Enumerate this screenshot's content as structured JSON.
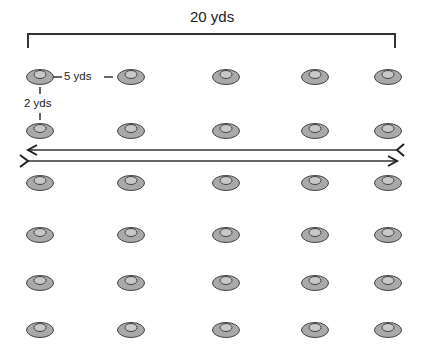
{
  "diagram": {
    "width_label": "20 yds",
    "column_spacing_label": "5 yds",
    "row_spacing_label": "2 yds",
    "grid": {
      "rows": 6,
      "columns": 5,
      "row_centers_y": [
        77,
        131,
        183,
        235,
        283,
        330
      ],
      "column_centers_x": [
        40,
        131,
        226,
        315,
        388
      ]
    },
    "arrows": [
      {
        "direction": "left",
        "y": 150
      },
      {
        "direction": "right",
        "y": 161
      }
    ],
    "colors": {
      "cone_outer": "#a9a9a9",
      "cone_inner": "#c8c8c8",
      "stroke": "#444444",
      "background": "#ffffff"
    }
  }
}
